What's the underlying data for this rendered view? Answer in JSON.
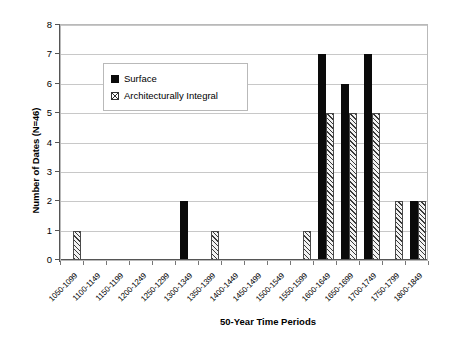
{
  "chart_data": {
    "type": "bar",
    "title": "",
    "xlabel": "50-Year Time Periods",
    "ylabel": "Number of Dates (N=46)",
    "ylim": [
      0,
      8
    ],
    "yticks": [
      0,
      1,
      2,
      3,
      4,
      5,
      6,
      7,
      8
    ],
    "grid": true,
    "legend_position": "upper-left-inside",
    "categories": [
      "1050-1099",
      "1100-1149",
      "1150-1199",
      "1200-1249",
      "1250-1299",
      "1300-1349",
      "1350-1399",
      "1400-1449",
      "1450-1499",
      "1500-1549",
      "1550-1599",
      "1600-1649",
      "1650-1699",
      "1700-1749",
      "1750-1799",
      "1800-1849"
    ],
    "series": [
      {
        "name": "Surface",
        "color": "#0a0a0a",
        "values": [
          0,
          0,
          0,
          0,
          0,
          2,
          0,
          0,
          0,
          0,
          0,
          7,
          6,
          7,
          0,
          2
        ]
      },
      {
        "name": "Architecturally Integral",
        "color": "#f2f2f2",
        "values": [
          1,
          0,
          0,
          0,
          0,
          0,
          1,
          0,
          0,
          0,
          1,
          5,
          5,
          5,
          2,
          2
        ]
      }
    ]
  },
  "legend": {
    "items": [
      {
        "label": "Surface",
        "swatch": "black-square-icon"
      },
      {
        "label": "Architecturally Integral",
        "swatch": "hatched-square-icon"
      }
    ]
  },
  "axes": {
    "y_title": "Number of Dates (N=46)",
    "x_title": "50-Year Time Periods"
  }
}
